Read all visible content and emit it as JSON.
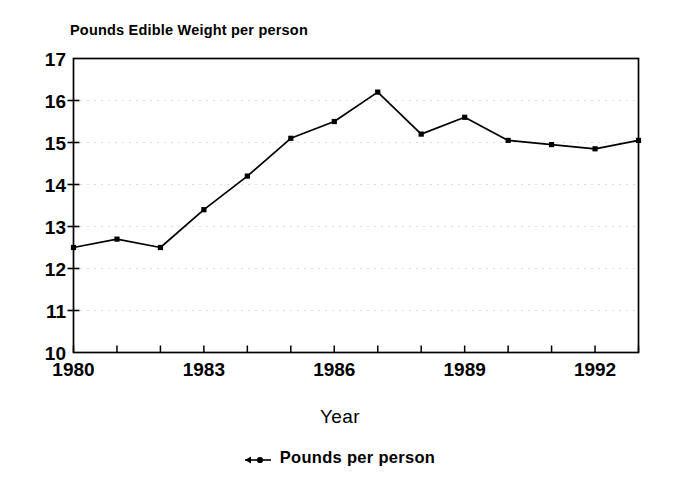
{
  "chart_data": {
    "type": "line",
    "title": "Pounds Edible Weight per person",
    "xlabel": "Year",
    "ylabel": "",
    "xlim": [
      1980,
      1993
    ],
    "ylim": [
      10,
      17
    ],
    "grid": true,
    "grid_style": "dotted-horizontal",
    "legend_position": "bottom-center",
    "x": [
      1980,
      1981,
      1982,
      1983,
      1984,
      1985,
      1986,
      1987,
      1988,
      1989,
      1990,
      1991,
      1992,
      1993
    ],
    "xtick_labels": [
      "1980",
      "1983",
      "1986",
      "1989",
      "1992"
    ],
    "xtick_values": [
      1980,
      1983,
      1986,
      1989,
      1992
    ],
    "ytick_labels": [
      "10",
      "11",
      "12",
      "13",
      "14",
      "15",
      "16",
      "17"
    ],
    "ytick_values": [
      10,
      11,
      12,
      13,
      14,
      15,
      16,
      17
    ],
    "series": [
      {
        "name": "Pounds per person",
        "marker": "square",
        "color": "#000000",
        "values": [
          12.5,
          12.7,
          12.5,
          13.4,
          14.2,
          15.1,
          15.5,
          16.2,
          15.2,
          15.6,
          15.05,
          14.95,
          14.85,
          15.05
        ]
      }
    ]
  },
  "legend": {
    "entries": [
      {
        "label": "Pounds per person"
      }
    ]
  },
  "axis": {
    "x_title": "Year"
  }
}
